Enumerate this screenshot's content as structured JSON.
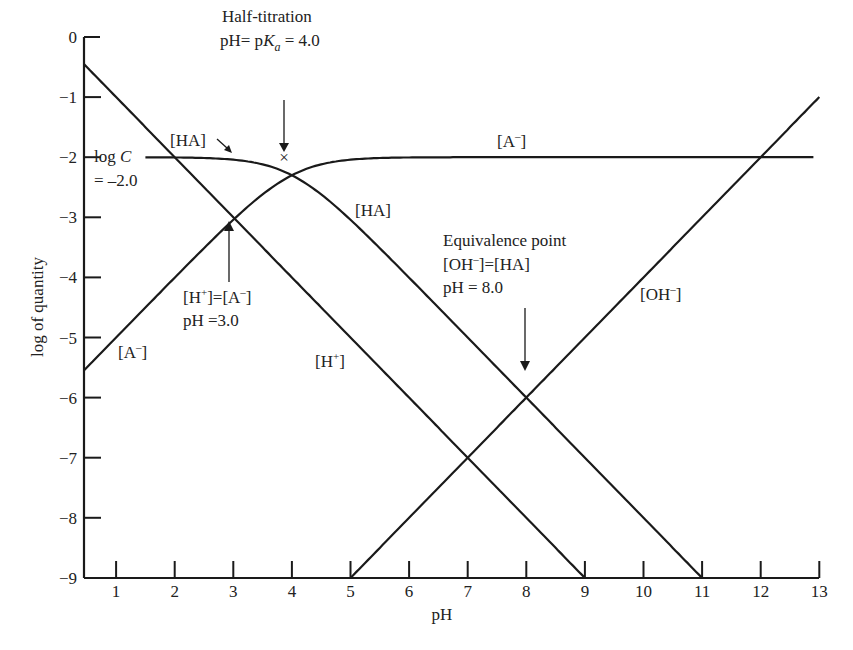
{
  "chart_data": {
    "type": "line",
    "title": "",
    "xlabel": "pH",
    "ylabel": "log of quantity",
    "xlim": [
      0.45,
      13
    ],
    "ylim": [
      -9,
      0
    ],
    "grid": false,
    "legend": "none (curves labeled inline)",
    "x_ticks": [
      1,
      2,
      3,
      4,
      5,
      6,
      7,
      8,
      9,
      10,
      11,
      12,
      13
    ],
    "y_ticks": [
      0,
      -1,
      -2,
      -3,
      -4,
      -5,
      -6,
      -7,
      -8,
      -9
    ],
    "params": {
      "C": 0.01,
      "logC": -2.0,
      "pKa": 4.0,
      "pKw": 14.0
    },
    "series": [
      {
        "name": "[H+]",
        "x": [
          0.45,
          1,
          2,
          3,
          4,
          5,
          6,
          7,
          8,
          9
        ],
        "values": [
          -0.45,
          -1,
          -2,
          -3,
          -4,
          -5,
          -6,
          -7,
          -8,
          -9
        ]
      },
      {
        "name": "[OH-]",
        "x": [
          5,
          6,
          7,
          8,
          9,
          10,
          11,
          12,
          13
        ],
        "values": [
          -9,
          -8,
          -7,
          -6,
          -5,
          -4,
          -3,
          -2,
          -1
        ]
      },
      {
        "name": "[HA]",
        "x": [
          1.5,
          2,
          3,
          4,
          5,
          6,
          7,
          8,
          9,
          10,
          11
        ],
        "values": [
          -2.0,
          -2.0,
          -2.04,
          -2.3,
          -3.04,
          -4.0,
          -5.0,
          -6.0,
          -7.0,
          -8.0,
          -9.0
        ]
      },
      {
        "name": "[A-]",
        "x": [
          0.45,
          1,
          2,
          3,
          4,
          5,
          6,
          7,
          8,
          9,
          10,
          11,
          12,
          12.9
        ],
        "values": [
          -5.55,
          -5.0,
          -4.0,
          -3.04,
          -2.3,
          -2.04,
          -2.0,
          -2.0,
          -2.0,
          -2.0,
          -2.0,
          -2.0,
          -2.0,
          -2.0
        ]
      }
    ],
    "annotations": [
      {
        "text": "Half-titration",
        "text2": "pH= p K_a = 4.0",
        "x": 4.0,
        "y": -2.3
      },
      {
        "text": "[H+]=[A-]",
        "text2": "pH =3.0",
        "x": 3.0,
        "y": -3.0
      },
      {
        "text": "Equivalence point",
        "text2": "[OH-]=[HA]",
        "text3": "pH = 8.0",
        "x": 8.0,
        "y": -6.0
      },
      {
        "text": "log C",
        "text2": "= -2.0",
        "x": 0.45,
        "y": -2.0
      }
    ]
  },
  "labels": {
    "half_titration_1": "Half-titration",
    "half_titration_2a": "pH= p",
    "half_titration_2b": "K",
    "half_titration_2c": "a",
    "half_titration_2d": " = 4.0",
    "logc_1a": "log ",
    "logc_1b": "C",
    "logc_2": "= –2.0",
    "ha_top": "[HA]",
    "ha_mid": "[HA]",
    "a_minus_right_1": "[A",
    "a_minus_right_sup": "–",
    "a_minus_right_2": "]",
    "a_minus_left_1": "[A",
    "a_minus_left_sup": "–",
    "a_minus_left_2": "]",
    "h_plus_1": "[H",
    "h_plus_sup": "+",
    "h_plus_2": "]",
    "oh_1": "[OH",
    "oh_sup": "–",
    "oh_2": "]",
    "h_eq_a_1": "[H",
    "h_eq_a_sup1": "+",
    "h_eq_a_2": "]=[A",
    "h_eq_a_sup2": "–",
    "h_eq_a_3": "]",
    "h_eq_a_ph": "pH =3.0",
    "equiv_1": "Equivalence point",
    "equiv_2a": "[OH",
    "equiv_2sup": "–",
    "equiv_2b": "]=[HA]",
    "equiv_3": "pH = 8.0",
    "half_marker": "×"
  },
  "axes": {
    "x_title": "pH",
    "y_title": "log of quantity",
    "x_tick_labels": [
      "1",
      "2",
      "3",
      "4",
      "5",
      "6",
      "7",
      "8",
      "9",
      "10",
      "11",
      "12",
      "13"
    ],
    "y_tick_labels": [
      "0",
      "-1",
      "-2",
      "-3",
      "-4",
      "-5",
      "-6",
      "-7",
      "-8",
      "-9"
    ]
  }
}
